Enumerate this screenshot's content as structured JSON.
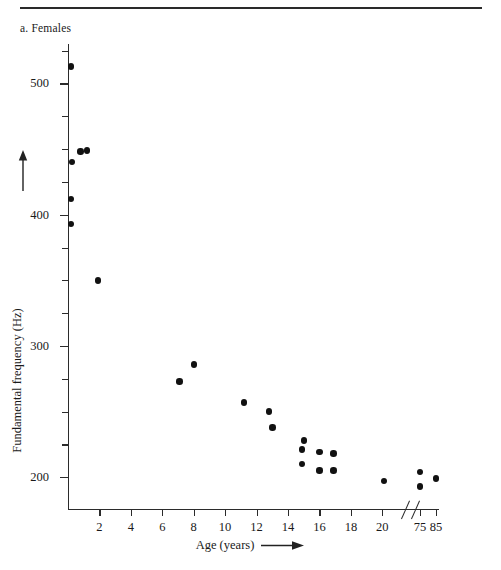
{
  "figure": {
    "panel_label": "a. Females",
    "top_rule_color": "#2a2a2a",
    "marker_color": "#111111",
    "axis_color": "#2b2b2b"
  },
  "axes": {
    "y_title": "Fundamental frequency (Hz)",
    "y_arrow_icon": "arrow-up-icon",
    "x_title": "Age (years)",
    "x_arrow_icon": "arrow-right-icon",
    "y_major_labels": [
      "500",
      "400",
      "300",
      "200"
    ],
    "x_labels": [
      "2",
      "4",
      "6",
      "8",
      "10",
      "12",
      "14",
      "16",
      "18",
      "20",
      "75",
      "85"
    ],
    "axis_break_icon": "axis-break-icon"
  },
  "chart_data": {
    "type": "scatter",
    "title": "a. Females",
    "xlabel": "Age (years)",
    "ylabel": "Fundamental frequency (Hz)",
    "xlim": [
      0,
      21.6
    ],
    "ylim": [
      175,
      530
    ],
    "grid": false,
    "legend": null,
    "x_tick_labels": [
      "2",
      "4",
      "6",
      "8",
      "10",
      "12",
      "14",
      "16",
      "18",
      "20",
      "75",
      "85"
    ],
    "x_tick_values": [
      2,
      4,
      6,
      8,
      10,
      12,
      14,
      16,
      18,
      20,
      75,
      85
    ],
    "y_major_ticks": [
      200,
      300,
      400,
      500
    ],
    "y_minor_ticks": [
      225,
      250,
      275,
      325,
      350,
      375,
      425,
      450,
      475,
      525
    ],
    "axis_break": {
      "present": true,
      "after_x_label": "20",
      "before_x_label": "75",
      "note": "x axis is broken between 20 and 75 years"
    },
    "points": [
      {
        "age": 0.2,
        "freq": 513
      },
      {
        "age": 0.25,
        "freq": 440
      },
      {
        "age": 0.8,
        "freq": 448
      },
      {
        "age": 1.2,
        "freq": 449
      },
      {
        "age": 0.2,
        "freq": 412
      },
      {
        "age": 0.2,
        "freq": 393
      },
      {
        "age": 1.9,
        "freq": 350
      },
      {
        "age": 7.1,
        "freq": 273
      },
      {
        "age": 8.0,
        "freq": 286
      },
      {
        "age": 11.2,
        "freq": 257
      },
      {
        "age": 12.8,
        "freq": 250
      },
      {
        "age": 13.0,
        "freq": 238
      },
      {
        "age": 14.9,
        "freq": 221
      },
      {
        "age": 14.9,
        "freq": 210
      },
      {
        "age": 15.0,
        "freq": 228
      },
      {
        "age": 16.0,
        "freq": 219
      },
      {
        "age": 16.0,
        "freq": 205
      },
      {
        "age": 16.9,
        "freq": 218
      },
      {
        "age": 16.9,
        "freq": 205
      },
      {
        "age": 20.1,
        "freq": 197
      },
      {
        "age": 75.0,
        "freq": 204
      },
      {
        "age": 75.0,
        "freq": 193
      },
      {
        "age": 85.0,
        "freq": 199
      }
    ]
  }
}
